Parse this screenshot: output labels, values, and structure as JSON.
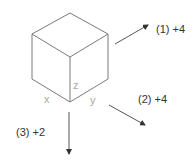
{
  "diagram": {
    "type": "isometric-cube-rotation",
    "cube": {
      "vertices": {
        "top": [
          70,
          13
        ],
        "left": [
          32,
          34
        ],
        "right": [
          108,
          34
        ],
        "center": [
          70,
          57
        ],
        "bottom_left": [
          32,
          79
        ],
        "bottom_right": [
          108,
          79
        ],
        "bottom": [
          70,
          102
        ]
      },
      "stroke_color": "#7a7a7a"
    },
    "axes": {
      "x": "x",
      "y": "y",
      "z": "z",
      "color": "#a8a8a8"
    },
    "steps": [
      {
        "label": "(1) +4",
        "direction": "up-right"
      },
      {
        "label": "(2) +4",
        "direction": "down-right"
      },
      {
        "label": "(3) +2",
        "direction": "down"
      }
    ],
    "arrow_color": "#555555"
  }
}
